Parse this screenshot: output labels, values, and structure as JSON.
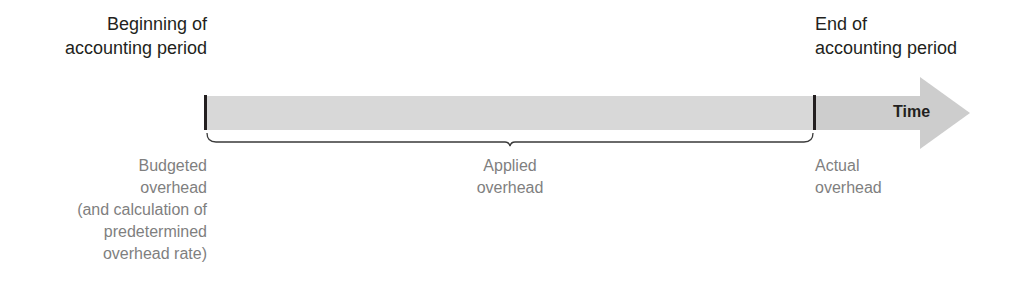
{
  "diagram": {
    "type": "timeline",
    "colors": {
      "bar_fill": "#d6d6d6",
      "bar_fill_dark": "#c8c8c8",
      "tick": "#231f20",
      "brace": "#3a3a3a",
      "heading_text": "#231f20",
      "label_text": "#7f7f7f"
    },
    "start_heading": {
      "lines": [
        "Beginning of",
        "accounting period"
      ]
    },
    "end_heading": {
      "lines": [
        "End of",
        "accounting period"
      ]
    },
    "arrow_label": "Time",
    "labels": {
      "budgeted": {
        "lines": [
          "Budgeted",
          "overhead",
          "(and calculation of",
          "predetermined",
          "overhead rate)"
        ]
      },
      "applied": {
        "lines": [
          "Applied",
          "overhead"
        ]
      },
      "actual": {
        "lines": [
          "Actual",
          "overhead"
        ]
      }
    }
  }
}
